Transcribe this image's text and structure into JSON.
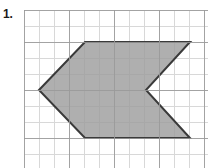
{
  "problem": {
    "number_label": "1.",
    "type": "geometry-area-figure"
  },
  "grid": {
    "origin_x": 24,
    "origin_y": 10,
    "width": 184,
    "height": 158,
    "cell_size": 15,
    "minor_color": "#d8d8d8",
    "major_color": "#9a9a9a",
    "major_every": 3,
    "minor_line_width": 1,
    "major_line_width": 1,
    "background": "#ffffff"
  },
  "figure": {
    "name": "chevron-arrow-polygon",
    "fill_color": "#9d9d9d",
    "fill_opacity": 0.82,
    "stroke_color": "#3a3a3a",
    "stroke_width": 2,
    "vertex_count": 6,
    "points_abs": [
      [
        39,
        90
      ],
      [
        85,
        42
      ],
      [
        190,
        42
      ],
      [
        146,
        90
      ],
      [
        190,
        138
      ],
      [
        85,
        138
      ]
    ],
    "points_svg": "15,80 61,32 166,32 122,80 166,128 61,128"
  },
  "colors": {
    "page_background": "#ffffff",
    "label_text": "#1a1a1a"
  }
}
